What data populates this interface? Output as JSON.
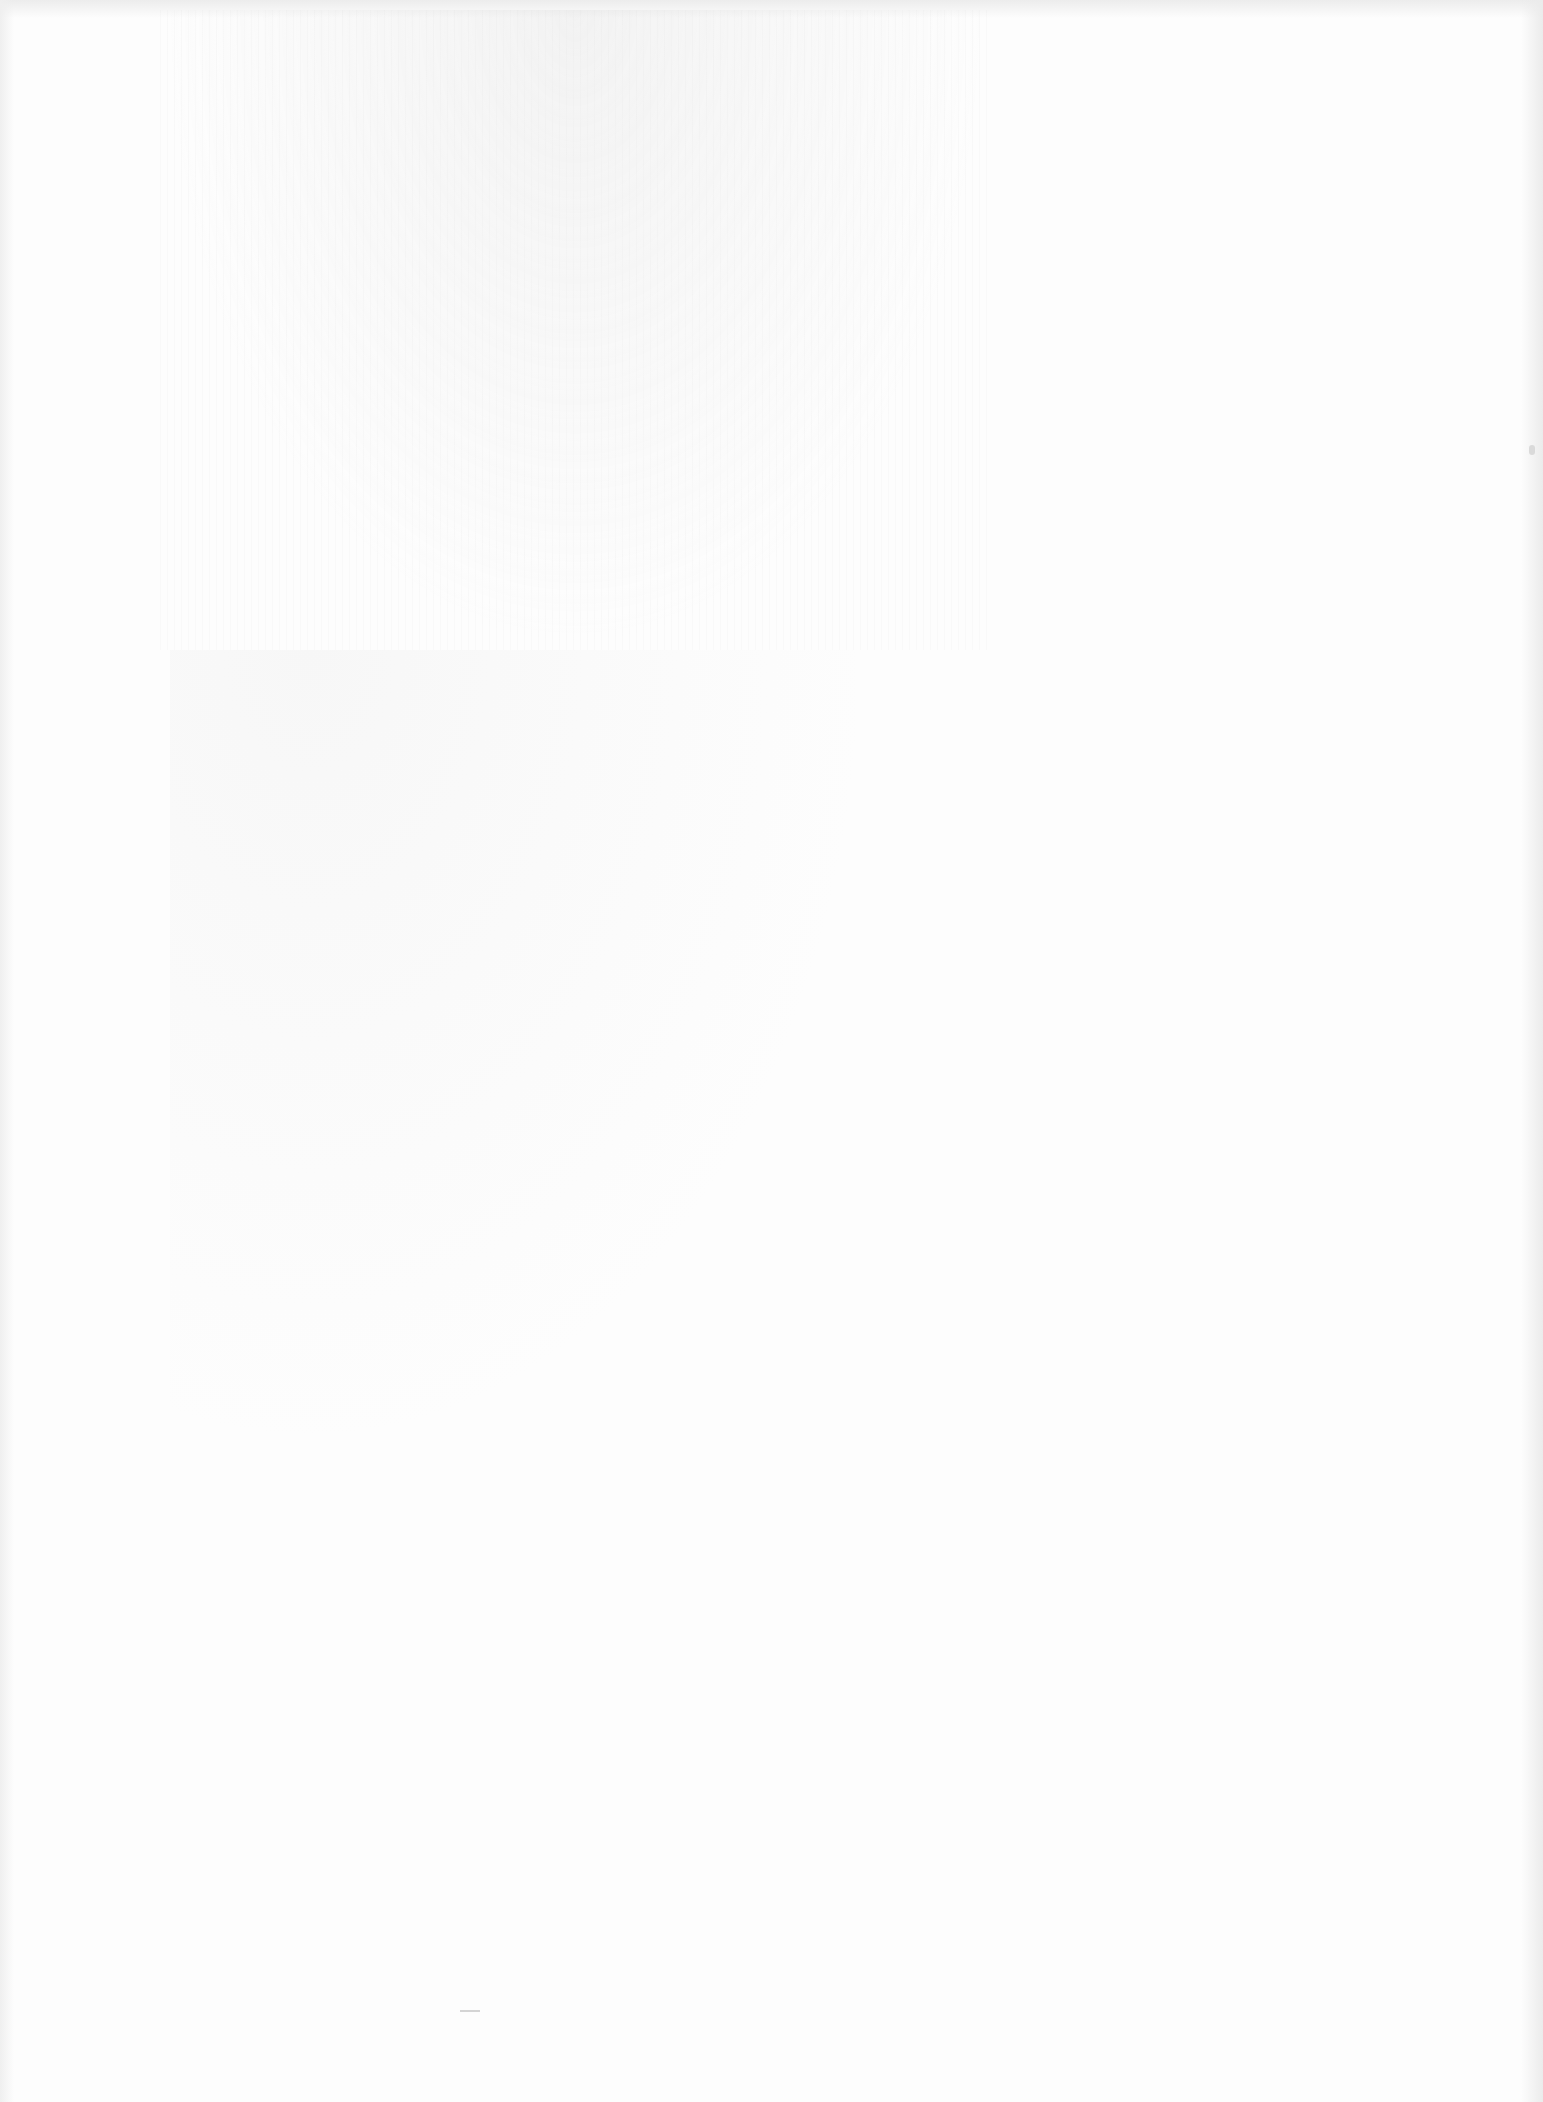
{
  "page": {
    "type": "blank scanned page",
    "text": "",
    "background_color": "#fdfdfd"
  }
}
